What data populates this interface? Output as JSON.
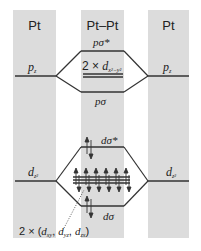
{
  "columns": [
    {
      "id": "left",
      "title": "Pt"
    },
    {
      "id": "center",
      "title": "Pt–Pt"
    },
    {
      "id": "right",
      "title": "Pt"
    }
  ],
  "levels": {
    "p_left": {
      "label": "p",
      "sub": "z"
    },
    "p_right": {
      "label": "p",
      "sub": "z"
    },
    "p_sigma_star": {
      "label": "pσ*"
    },
    "d_x2y2": {
      "prefix": "2 × ",
      "label": "d",
      "sub": "x²−y²"
    },
    "p_sigma": {
      "label": "pσ"
    },
    "d_left": {
      "label": "d",
      "sub": "z²"
    },
    "d_right": {
      "label": "d",
      "sub": "z²"
    },
    "d_sigma_star": {
      "label": "dσ*"
    },
    "d_sigma": {
      "label": "dσ"
    },
    "d_degenerate": {
      "prefix": "2 × (",
      "d1": "d",
      "s1": "xy",
      "sep1": ", ",
      "d2": "d",
      "s2": "yz",
      "sep2": ", ",
      "d3": "d",
      "s3": "zx",
      "suffix": ")"
    }
  },
  "colors": {
    "column_bg": "#dcdcdc",
    "line": "#333333",
    "text": "#222222"
  }
}
